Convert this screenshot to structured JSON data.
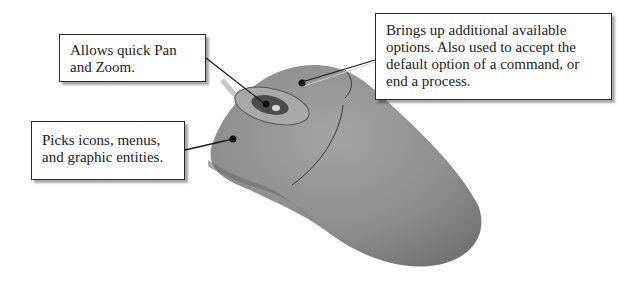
{
  "figure": {
    "colors": {
      "mouse_body": "#8a8a8a",
      "mouse_top": "#9a9a9a",
      "wheel": "#4a4a4a",
      "leader_line": "#1a1a1a",
      "callout_border": "#2a2a2a"
    }
  },
  "callouts": {
    "middle": {
      "target": "middle button / wheel",
      "text": "Allows quick Pan\nand Zoom."
    },
    "left": {
      "target": "left mouse button",
      "text": "Picks icons, menus,\nand graphic entities."
    },
    "right": {
      "target": "right mouse button",
      "text": "Brings up additional available\noptions. Also used to accept the\ndefault option of a command, or\nend a process."
    }
  }
}
